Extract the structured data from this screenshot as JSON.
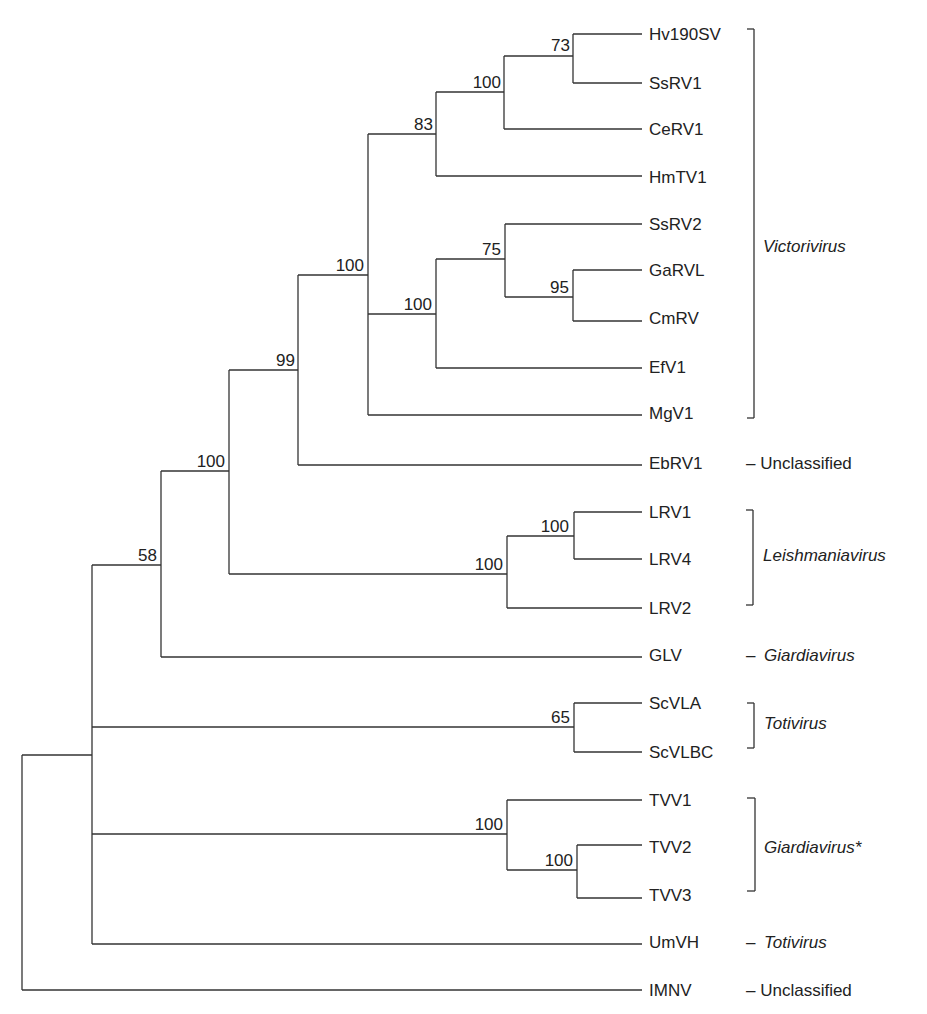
{
  "figure": {
    "type": "phylogenetic-tree",
    "leaves": [
      {
        "label": "Hv190SV",
        "y": 34
      },
      {
        "label": "SsRV1",
        "y": 83
      },
      {
        "label": "CeRV1",
        "y": 129
      },
      {
        "label": "HmTV1",
        "y": 177
      },
      {
        "label": "SsRV2",
        "y": 224
      },
      {
        "label": "GaRVL",
        "y": 270
      },
      {
        "label": "CmRV",
        "y": 318
      },
      {
        "label": "EfV1",
        "y": 367
      },
      {
        "label": "MgV1",
        "y": 413
      },
      {
        "label": "EbRV1",
        "y": 463
      },
      {
        "label": "LRV1",
        "y": 512
      },
      {
        "label": "LRV4",
        "y": 559
      },
      {
        "label": "LRV2",
        "y": 608
      },
      {
        "label": "GLV",
        "y": 655
      },
      {
        "label": "ScVLA",
        "y": 703
      },
      {
        "label": "ScVLBC",
        "y": 752
      },
      {
        "label": "TVV1",
        "y": 800
      },
      {
        "label": "TVV2",
        "y": 847
      },
      {
        "label": "TVV3",
        "y": 895
      },
      {
        "label": "UmVH",
        "y": 942
      },
      {
        "label": "IMNV",
        "y": 990
      }
    ],
    "support_values": [
      {
        "value": "73",
        "node": "Hv190SV+SsRV1"
      },
      {
        "value": "100",
        "node": "Hv190SV+SsRV1+CeRV1"
      },
      {
        "value": "83",
        "node": "Hv190SV..HmTV1"
      },
      {
        "value": "95",
        "node": "GaRVL+CmRV"
      },
      {
        "value": "75",
        "node": "SsRV2+GaRVL+CmRV"
      },
      {
        "value": "100",
        "node": "SsRV2..EfV1"
      },
      {
        "value": "100",
        "node": "Victorivirus clade"
      },
      {
        "value": "99",
        "node": "Victorivirus+EbRV1"
      },
      {
        "value": "100",
        "node": "LRV1+LRV4"
      },
      {
        "value": "100",
        "node": "Leishmaniavirus clade"
      },
      {
        "value": "100",
        "node": "Victorivirus+EbRV1+Leishmaniavirus"
      },
      {
        "value": "58",
        "node": "with GLV"
      },
      {
        "value": "65",
        "node": "ScVLA+ScVLBC"
      },
      {
        "value": "100",
        "node": "TVV clade"
      },
      {
        "value": "100",
        "node": "TVV2+TVV3"
      }
    ],
    "groups": [
      {
        "label": "Victorivirus",
        "style": "bracket",
        "italic": true,
        "from": "Hv190SV",
        "to": "MgV1"
      },
      {
        "label": "– Unclassified",
        "style": "dash",
        "italic": false,
        "leaf": "EbRV1"
      },
      {
        "label": "Leishmaniavirus",
        "style": "bracket",
        "italic": true,
        "from": "LRV1",
        "to": "LRV2"
      },
      {
        "label": "Giardiavirus",
        "style": "dash",
        "italic": true,
        "leaf": "GLV"
      },
      {
        "label": "Totivirus",
        "style": "bracket",
        "italic": true,
        "from": "ScVLA",
        "to": "ScVLBC"
      },
      {
        "label": "Giardiavirus*",
        "style": "bracket",
        "italic": true,
        "from": "TVV1",
        "to": "TVV3"
      },
      {
        "label": "Totivirus",
        "style": "dash",
        "italic": true,
        "leaf": "UmVH"
      },
      {
        "label": "– Unclassified",
        "style": "dash",
        "italic": false,
        "leaf": "IMNV"
      }
    ],
    "dash_glyph": "–"
  }
}
